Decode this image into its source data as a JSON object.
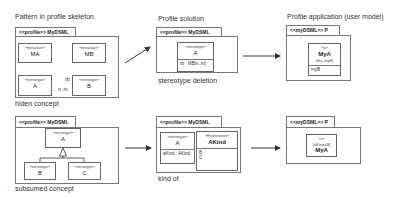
{
  "panels": {
    "pattern": {
      "title": "Pattern in profile skeleton",
      "tab": "<<profile>> MyDSML",
      "classes": {
        "ma": {
          "stereotype": "«metaclass»",
          "name": "MA"
        },
        "mb": {
          "stereotype": "«metaclass»",
          "name": "MB"
        },
        "a": {
          "stereotype": "«stereotype»",
          "name": "A"
        },
        "b": {
          "stereotype": "«stereotype»",
          "name": "B"
        }
      },
      "association": {
        "role": "rb",
        "multiplicity": "n..m"
      },
      "caption": "hiden concept"
    },
    "solution": {
      "title": "Profile solution",
      "tab": "<<profile>> MyDSML",
      "class_a": {
        "stereotype": "«stereotype»",
        "name": "A",
        "attribute": "rb : MB[n..m]"
      },
      "caption": "stereotype deletion"
    },
    "application": {
      "title": "Profile application (user model)",
      "tab": "<<myDSML>> P",
      "instance": {
        "stereotype": "«a»",
        "name": "MyA",
        "tagged": "{rb= myB}",
        "attribute": "myB"
      }
    },
    "subsumed": {
      "tab": "<<profile>> MyDSML",
      "classes": {
        "a": {
          "stereotype": "«stereotype»",
          "name": "A"
        },
        "b": {
          "stereotype": "«stereotype»",
          "name": "B"
        },
        "c": {
          "stereotype": "«stereotype»",
          "name": "C"
        }
      },
      "caption": "subsumed concept"
    },
    "kindof": {
      "tab": "<<profile>> MyDSML",
      "class_a": {
        "stereotype": "«stereotype»",
        "name": "A",
        "attribute": "aKind : AKind"
      },
      "enum": {
        "stereotype": "«Enumeration»",
        "name": "AKind",
        "literals": [
          "B",
          "C"
        ]
      },
      "caption": "kind of"
    },
    "application2": {
      "tab": "<<myDSML>> P",
      "instance": {
        "stereotype": "«a»",
        "tagged": "{aKind=B}",
        "name": "MyA"
      }
    }
  },
  "colors": {
    "line": "#444444",
    "border": "#777777"
  }
}
